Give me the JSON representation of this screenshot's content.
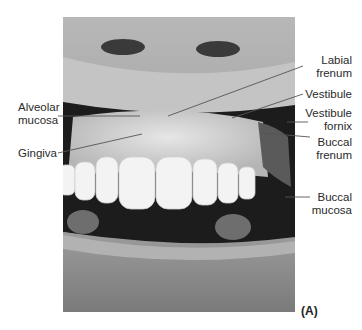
{
  "figure": {
    "panel_label": "(A)",
    "labels": {
      "alveolar_mucosa": [
        "Alveolar",
        "mucosa"
      ],
      "gingiva": "Gingiva",
      "labial_frenum": [
        "Labial",
        "frenum"
      ],
      "vestibule": "Vestibule",
      "vestibule_fornix": [
        "Vestibule",
        "fornix"
      ],
      "buccal_frenum": [
        "Buccal",
        "frenum"
      ],
      "buccal_mucosa": [
        "Buccal",
        "mucosa"
      ]
    },
    "colors": {
      "leader_line": "#555555",
      "photo_dark": "#1a1a1a",
      "skin": "#9a9a9a",
      "teeth": "#f2f2f2",
      "gum": "#d6d6d6"
    }
  }
}
